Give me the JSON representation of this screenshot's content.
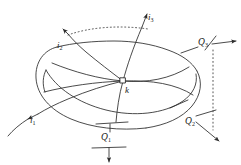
{
  "figure": {
    "type": "technical-line-diagram",
    "background_color": "#ffffff",
    "line_color": "#2b2b2b",
    "node": {
      "label": "k",
      "shape": "small-open-square",
      "x": 123,
      "y": 81
    },
    "currents": [
      {
        "id": "i3",
        "label": "i",
        "subscript": "3",
        "label_x": 148,
        "label_y": 13,
        "arrow_direction": "up-right",
        "description": "current line entering from lower centre and leaving at the top"
      },
      {
        "id": "i2",
        "label": "i",
        "subscript": "2",
        "label_x": 58,
        "label_y": 43,
        "arrow_direction": "up-left",
        "description": "current line leaving at the upper left"
      },
      {
        "id": "i1",
        "label": "i",
        "subscript": "1",
        "label_x": 31,
        "label_y": 118,
        "arrow_direction": "down-left",
        "description": "current line leaving at the lower left"
      }
    ],
    "heat_fluxes": [
      {
        "id": "Q3",
        "label": "Q",
        "subscript": "3",
        "accent": "·",
        "label_x": 199,
        "label_y": 39,
        "arrow_direction": "right",
        "description": "heat flux arrow pointing to the right at the upper right, drawn between two short tick bars"
      },
      {
        "id": "Q2",
        "label": "Q",
        "subscript": "2",
        "accent": "·",
        "label_x": 186,
        "label_y": 118,
        "arrow_direction": "down-right",
        "description": "heat flux arrow pointing down-right at the lower right, drawn between two short tick bars"
      },
      {
        "id": "Q1",
        "label": "Q",
        "subscript": "1",
        "accent": "·",
        "label_x": 102,
        "label_y": 137,
        "arrow_direction": "down",
        "description": "heat flux arrow pointing downward at the bottom centre, drawn between two short tick bars"
      }
    ],
    "guides": [
      {
        "id": "top-dotted-arc",
        "style": "dotted",
        "description": "dotted arc along the hidden upper rear edge of the body"
      },
      {
        "id": "right-dotted-line",
        "style": "dotted",
        "description": "vertical dotted line at the right edge of the body"
      }
    ],
    "body_outline": {
      "description": "closed irregular loop (flattened torus seen in perspective) with two internal sweeping curves crossing at node k"
    }
  }
}
